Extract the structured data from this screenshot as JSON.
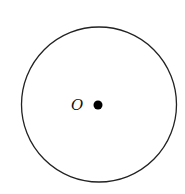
{
  "diagram": {
    "type": "geometry-circle",
    "circle": {
      "cx": 99,
      "cy": 104,
      "r": 78,
      "stroke": "#222222",
      "fill": "none"
    },
    "center_point": {
      "cx": 98,
      "cy": 105,
      "r": 4.5,
      "color": "#000000"
    },
    "center_label": {
      "text": "O",
      "x": 71,
      "y": 110
    }
  }
}
